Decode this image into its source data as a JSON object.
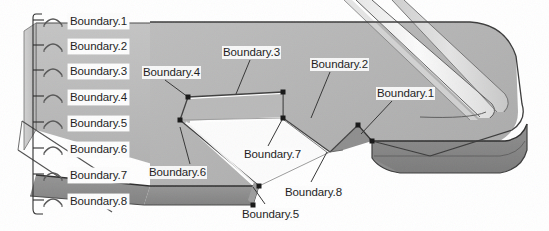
{
  "figure": {
    "kind": "cad-3d-boundary-callout-diagram",
    "colors": {
      "background": "#ffffff",
      "top_face": "#b3b3b3",
      "top_face_light": "#c2c2c2",
      "side_face_dark": "#8d8d8d",
      "side_face_darker": "#7e7e7e",
      "rim_highlight": "#ededed",
      "rim_highlight_bright": "#f8f8f8",
      "cutout_white": "#fcfcfc",
      "outline": "#4a4a4a",
      "leader_line": "#3a3a3a",
      "vertex_dot": "#161616",
      "label_text": "#1b1b1b",
      "label_plate": "#fdfdfd"
    }
  },
  "legend": {
    "name": "boundary-list",
    "bracket": {
      "x": 33,
      "top": 14,
      "bottom": 214,
      "tick_length": 11
    },
    "items": [
      {
        "label": "Boundary.1",
        "x": 68,
        "y": 14,
        "tick_y": 20,
        "glyph": "arc-marker"
      },
      {
        "label": "Boundary.2",
        "x": 68,
        "y": 39,
        "tick_y": 45,
        "glyph": "arc-marker"
      },
      {
        "label": "Boundary.3",
        "x": 68,
        "y": 64,
        "tick_y": 70,
        "glyph": "arc-marker"
      },
      {
        "label": "Boundary.4",
        "x": 68,
        "y": 90,
        "tick_y": 96,
        "glyph": "arc-marker"
      },
      {
        "label": "Boundary.5",
        "x": 68,
        "y": 116,
        "tick_y": 122,
        "glyph": "arc-marker"
      },
      {
        "label": "Boundary.6",
        "x": 68,
        "y": 142,
        "tick_y": 148,
        "glyph": "arc-marker"
      },
      {
        "label": "Boundary.7",
        "x": 68,
        "y": 168,
        "tick_y": 174,
        "glyph": "arc-marker"
      },
      {
        "label": "Boundary.8",
        "x": 68,
        "y": 194,
        "tick_y": 200,
        "glyph": "arc-marker"
      }
    ]
  },
  "callouts": [
    {
      "id": "callout-boundary-4",
      "label": "Boundary.4",
      "text_x": 142,
      "text_y": 66,
      "leader": [
        [
          165,
          80
        ],
        [
          188,
          97
        ]
      ],
      "vertex": [
        188,
        97
      ]
    },
    {
      "id": "callout-boundary-3",
      "label": "Boundary.3",
      "text_x": 222,
      "text_y": 46,
      "leader": [
        [
          250,
          60
        ],
        [
          236,
          94
        ]
      ],
      "vertex": null
    },
    {
      "id": "callout-boundary-2",
      "label": "Boundary.2",
      "text_x": 310,
      "text_y": 58,
      "leader": [
        [
          330,
          72
        ],
        [
          311,
          118
        ]
      ],
      "vertex": null
    },
    {
      "id": "callout-boundary-1",
      "label": "Boundary.1",
      "text_x": 376,
      "text_y": 87,
      "leader": [
        [
          392,
          101
        ],
        [
          361,
          134
        ]
      ],
      "vertex": [
        358,
        125
      ]
    },
    {
      "id": "callout-boundary-7",
      "label": "Boundary.7",
      "text_x": 243,
      "text_y": 148,
      "leader": [
        [
          268,
          146
        ],
        [
          283,
          118
        ]
      ],
      "vertex": [
        283,
        118
      ]
    },
    {
      "id": "callout-boundary-6",
      "label": "Boundary.6",
      "text_x": 148,
      "text_y": 166,
      "leader": [
        [
          190,
          164
        ],
        [
          180,
          127
        ]
      ],
      "vertex": [
        180,
        120
      ]
    },
    {
      "id": "callout-boundary-8",
      "label": "Boundary.8",
      "text_x": 284,
      "text_y": 186,
      "leader": [
        [
          311,
          182
        ],
        [
          327,
          152
        ]
      ],
      "vertex": null
    },
    {
      "id": "callout-boundary-5",
      "label": "Boundary.5",
      "text_x": 241,
      "text_y": 208,
      "leader": [
        [
          265,
          204
        ],
        [
          253,
          187
        ]
      ],
      "vertex": [
        253,
        186
      ]
    }
  ],
  "vertices": [
    {
      "name": "notch-vertex-upper-left",
      "x": 188,
      "y": 97
    },
    {
      "name": "notch-vertex-upper-right",
      "x": 283,
      "y": 92
    },
    {
      "name": "notch-vertex-inner-left",
      "x": 180,
      "y": 120
    },
    {
      "name": "notch-vertex-inner-right",
      "x": 283,
      "y": 118
    },
    {
      "name": "step-vertex-top",
      "x": 358,
      "y": 125
    },
    {
      "name": "step-vertex-bottom",
      "x": 372,
      "y": 141
    },
    {
      "name": "slab-corner-top",
      "x": 259,
      "y": 186
    },
    {
      "name": "slab-corner-bottom",
      "x": 253,
      "y": 205
    }
  ]
}
